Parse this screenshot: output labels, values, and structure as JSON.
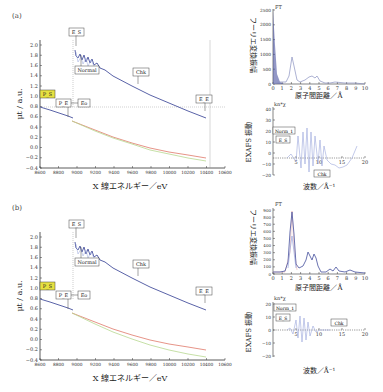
{
  "panels": [
    {
      "label": "(a)",
      "main": {
        "xlabel": "X 線エネルギー／eV",
        "ylabel": "μt / a.u.",
        "xticks": [
          "8600",
          "8800",
          "9000",
          "9200",
          "9400",
          "9600",
          "9800",
          "10000",
          "10200",
          "10400",
          "10600"
        ],
        "yticks": [
          "2.0",
          "1.8",
          "1.6",
          "1.4",
          "1.2",
          "1.0",
          "0.8",
          "0.6",
          "0.4",
          "0.2",
          "0.0",
          "−0.2",
          "−0.4"
        ],
        "markers": {
          "P_S": "P_S",
          "P_E": "P_E",
          "Eo": "Eo",
          "E_S": "E_S",
          "Normal": "Normal",
          "Chk": "Chk",
          "E_E": "E_E"
        }
      },
      "ft": {
        "title": "FT",
        "ylabel": "フーリエ変換振幅",
        "xlabel": "原子間距離／Å",
        "yticks": [
          "2500",
          "2000",
          "1500",
          "1000",
          "500",
          "0"
        ],
        "xticks": [
          "0",
          "1",
          "2",
          "3",
          "4",
          "5",
          "6",
          "7",
          "8",
          "9",
          "10"
        ]
      },
      "exafs": {
        "title": "kn*χ",
        "ylabel": "EXAFS 振動",
        "xlabel": "波数／Å⁻¹",
        "yticks": [
          "40",
          "30",
          "20",
          "10",
          "0",
          "−10",
          "−20"
        ],
        "xticks": [
          "5",
          "10",
          "15",
          "20"
        ],
        "markers": {
          "Norm_1": "Norm_1",
          "E_S": "E_S",
          "Chk": "Chk"
        }
      }
    },
    {
      "label": "(b)",
      "main": {
        "xlabel": "X 線エネルギー／eV",
        "ylabel": "μt / a.u.",
        "xticks": [
          "8600",
          "8800",
          "9000",
          "9200",
          "9400",
          "9600",
          "9800",
          "10000",
          "10200",
          "10400",
          "10600"
        ],
        "yticks": [
          "2.0",
          "1.8",
          "1.6",
          "1.4",
          "1.2",
          "1.0",
          "0.8",
          "0.6",
          "0.4",
          "0.2",
          "0.0",
          "−0.2",
          "−0.4"
        ],
        "markers": {
          "P_S": "P_S",
          "P_E": "P_E",
          "Eo": "Eo",
          "E_S": "E_S",
          "Normal": "Normal",
          "Chk": "Chk",
          "E_E": "E_E"
        }
      },
      "ft": {
        "title": "FT",
        "ylabel": "フーリエ変換振幅",
        "xlabel": "原子間距離／Å",
        "yticks": [
          "900",
          "800",
          "700",
          "600",
          "500",
          "400",
          "300",
          "200",
          "100",
          "0"
        ],
        "xticks": [
          "0",
          "1",
          "2",
          "3",
          "4",
          "5",
          "6",
          "7",
          "8",
          "9",
          "10"
        ]
      },
      "exafs": {
        "title": "kn*χ",
        "ylabel": "EXAFS 振動",
        "xlabel": "波数／Å⁻¹",
        "yticks": [
          "20",
          "10",
          "0",
          "−10",
          "−20"
        ],
        "xticks": [
          "5",
          "10",
          "15",
          "20"
        ],
        "markers": {
          "Norm_1": "Norm_1",
          "E_S": "E_S",
          "Chk": "Chk"
        }
      }
    }
  ],
  "colors": {
    "absorption": "#5a63a8",
    "pre_edge_red": "#e0786a",
    "pre_edge_green": "#b8d890",
    "marker_highlight": "#e6e040",
    "grid": "#888888"
  },
  "chart_data": [
    {
      "type": "line",
      "panel": "(a) main",
      "xlabel": "X 線エネルギー／eV",
      "ylabel": "μt / a.u.",
      "xlim": [
        8600,
        10600
      ],
      "ylim": [
        -0.4,
        2.1
      ],
      "series": [
        {
          "name": "absorption",
          "x": [
            8600,
            8700,
            8800,
            8900,
            8960,
            8980,
            9000,
            9050,
            9100,
            9150,
            9200,
            9260,
            9300,
            9400,
            9600,
            9800,
            10000,
            10200,
            10400
          ],
          "y": [
            0.8,
            0.74,
            0.68,
            0.62,
            0.58,
            2.0,
            1.9,
            1.95,
            1.8,
            1.85,
            1.7,
            1.72,
            1.65,
            1.55,
            1.35,
            1.17,
            1.0,
            0.85,
            0.7
          ]
        },
        {
          "name": "pre-edge fit (red)",
          "x": [
            8950,
            9200,
            9400,
            9600,
            9800,
            10000,
            10200,
            10400
          ],
          "y": [
            0.55,
            0.38,
            0.25,
            0.12,
            0.0,
            -0.07,
            -0.13,
            -0.18
          ]
        },
        {
          "name": "pre-edge fit (green)",
          "x": [
            8950,
            9200,
            9400,
            9600,
            9800,
            10000,
            10200,
            10400
          ],
          "y": [
            0.55,
            0.37,
            0.23,
            0.1,
            -0.02,
            -0.1,
            -0.17,
            -0.22
          ]
        }
      ],
      "annotations": [
        "P_S",
        "P_E",
        "Eo",
        "E_S",
        "Normal",
        "Chk",
        "E_E"
      ],
      "hline_y": 0.78,
      "vlines_x": [
        8970,
        10450
      ]
    },
    {
      "type": "line",
      "panel": "(a) FT",
      "xlabel": "原子間距離／Å",
      "ylabel": "フーリエ変換振幅",
      "xlim": [
        0,
        10
      ],
      "ylim": [
        0,
        2500
      ],
      "series": [
        {
          "name": "FT",
          "x": [
            0,
            0.2,
            0.5,
            1,
            1.5,
            2,
            2.3,
            2.6,
            3,
            3.5,
            4,
            4.3,
            4.6,
            5,
            5.5,
            6,
            7,
            8,
            9,
            10
          ],
          "y": [
            2500,
            1200,
            300,
            80,
            50,
            200,
            900,
            250,
            100,
            150,
            300,
            200,
            280,
            120,
            60,
            40,
            50,
            30,
            30,
            20
          ]
        }
      ]
    },
    {
      "type": "line",
      "panel": "(a) EXAFS",
      "xlabel": "波数／Å⁻¹",
      "ylabel": "EXAFS 振動",
      "xlim": [
        0,
        20
      ],
      "ylim": [
        -20,
        40
      ],
      "series": [
        {
          "name": "kn*χ",
          "x": [
            3,
            4,
            5,
            5.5,
            6,
            6.5,
            7,
            7.5,
            8,
            8.5,
            9,
            9.5,
            10,
            10.5,
            11,
            11.5,
            12,
            13,
            14,
            15,
            16,
            17,
            18,
            19
          ],
          "y": [
            0,
            5,
            -5,
            25,
            -15,
            30,
            -10,
            35,
            -20,
            30,
            -15,
            25,
            -10,
            20,
            -12,
            15,
            -5,
            -10,
            -8,
            -15,
            -12,
            -10,
            5,
            20
          ]
        }
      ]
    },
    {
      "type": "line",
      "panel": "(b) main",
      "xlabel": "X 線エネルギー／eV",
      "ylabel": "μt / a.u.",
      "xlim": [
        8600,
        10600
      ],
      "ylim": [
        -0.4,
        2.1
      ],
      "series": [
        {
          "name": "absorption",
          "x": [
            8600,
            8700,
            8800,
            8900,
            8960,
            8980,
            9000,
            9050,
            9100,
            9150,
            9200,
            9260,
            9300,
            9400,
            9600,
            9800,
            10000,
            10200,
            10400
          ],
          "y": [
            0.8,
            0.74,
            0.68,
            0.62,
            0.58,
            2.0,
            1.9,
            1.95,
            1.8,
            1.85,
            1.7,
            1.72,
            1.65,
            1.55,
            1.35,
            1.17,
            1.0,
            0.85,
            0.7
          ]
        },
        {
          "name": "pre-edge fit (red)",
          "x": [
            8950,
            9200,
            9400,
            9600,
            9800,
            10000,
            10200,
            10400
          ],
          "y": [
            0.55,
            0.38,
            0.25,
            0.12,
            0.02,
            -0.05,
            -0.12,
            -0.18
          ]
        },
        {
          "name": "pre-edge fit (green)",
          "x": [
            8950,
            9200,
            9400,
            9600,
            9800,
            10000,
            10200,
            10400
          ],
          "y": [
            0.55,
            0.36,
            0.2,
            0.06,
            -0.06,
            -0.15,
            -0.22,
            -0.3
          ]
        }
      ],
      "annotations": [
        "P_S",
        "P_E",
        "Eo",
        "E_S",
        "Normal",
        "Chk",
        "E_E"
      ],
      "vlines_x": [
        8970
      ]
    },
    {
      "type": "line",
      "panel": "(b) FT",
      "xlabel": "原子間距離／Å",
      "ylabel": "フーリエ変換振幅",
      "xlim": [
        0,
        10
      ],
      "ylim": [
        0,
        900
      ],
      "series": [
        {
          "name": "FT",
          "x": [
            0,
            0.5,
            1,
            1.5,
            2,
            2.2,
            2.4,
            2.7,
            3,
            3.5,
            4,
            4.3,
            4.6,
            4.9,
            5.2,
            5.6,
            6,
            6.5,
            7,
            7.5,
            8,
            9,
            10
          ],
          "y": [
            20,
            30,
            30,
            50,
            500,
            880,
            500,
            120,
            80,
            150,
            270,
            200,
            260,
            150,
            80,
            30,
            20,
            40,
            20,
            60,
            20,
            30,
            10
          ]
        }
      ]
    },
    {
      "type": "line",
      "panel": "(b) EXAFS",
      "xlabel": "波数／Å⁻¹",
      "ylabel": "EXAFS 振動",
      "xlim": [
        0,
        20
      ],
      "ylim": [
        -20,
        20
      ],
      "series": [
        {
          "name": "kn*χ",
          "x": [
            3,
            4,
            4.5,
            5,
            5.5,
            6,
            6.5,
            7,
            7.5,
            8,
            8.5,
            9,
            10,
            11,
            12,
            14,
            16,
            18,
            20
          ],
          "y": [
            0,
            3,
            -5,
            10,
            -12,
            15,
            -18,
            14,
            -10,
            8,
            -5,
            3,
            1,
            0,
            0,
            0,
            0,
            0,
            0
          ]
        }
      ]
    }
  ]
}
